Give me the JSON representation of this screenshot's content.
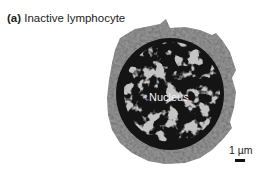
{
  "figure": {
    "caption_label": "(a)",
    "caption_text": "Inactive lymphocyte",
    "annotations": {
      "nucleus": "Nucleus"
    },
    "scale_bar": {
      "label": "1 µm"
    }
  }
}
